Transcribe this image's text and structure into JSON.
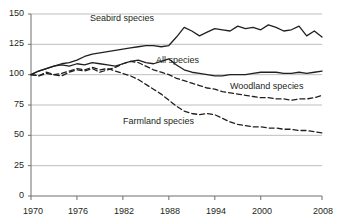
{
  "chart_data": {
    "type": "line",
    "title": "",
    "subtitle": "",
    "xlabel": "",
    "ylabel": "",
    "xlim": [
      1970,
      2008
    ],
    "ylim": [
      0,
      150
    ],
    "yticks": [
      0,
      25,
      50,
      75,
      100,
      125,
      150
    ],
    "ytick_labels": [
      "0",
      "25",
      "50",
      "75",
      "100",
      "125",
      "150"
    ],
    "xticks": [
      1970,
      1976,
      1982,
      1988,
      1994,
      2000,
      2008
    ],
    "xtick_labels": [
      "1970",
      "1976",
      "1982",
      "1988",
      "1994",
      "2000",
      "2008"
    ],
    "grid": "horizontal",
    "legend": "inline-annotations",
    "index_base": 100,
    "x": [
      1970,
      1971,
      1972,
      1973,
      1974,
      1975,
      1976,
      1977,
      1978,
      1979,
      1980,
      1981,
      1982,
      1983,
      1984,
      1985,
      1986,
      1987,
      1988,
      1989,
      1990,
      1991,
      1992,
      1993,
      1994,
      1995,
      1996,
      1997,
      1998,
      1999,
      2000,
      2001,
      2002,
      2003,
      2004,
      2005,
      2006,
      2007,
      2008
    ],
    "series": [
      {
        "name": "Seabird species",
        "style": "solid",
        "color": "#231f20",
        "label_x": 1977.5,
        "label_y": 137,
        "values": [
          100,
          103,
          105,
          107,
          109,
          110,
          112,
          115,
          117,
          118,
          119,
          120,
          121,
          122,
          123,
          124,
          124,
          123,
          124,
          131,
          139,
          136,
          132,
          135,
          138,
          137,
          136,
          140,
          138,
          139,
          137,
          141,
          139,
          136,
          137,
          140,
          132,
          136,
          131
        ]
      },
      {
        "name": "All species",
        "style": "solid",
        "color": "#231f20",
        "label_x": 1989.5,
        "label_y": 108,
        "values": [
          100,
          103,
          105,
          107,
          108,
          107,
          109,
          108,
          110,
          109,
          108,
          107,
          109,
          111,
          112,
          110,
          109,
          111,
          113,
          108,
          104,
          102,
          101,
          100,
          99,
          99,
          100,
          100,
          100,
          101,
          102,
          102,
          102,
          101,
          101,
          102,
          101,
          102,
          103
        ]
      },
      {
        "name": "Woodland species",
        "style": "dashed",
        "color": "#231f20",
        "label_x": 1998.0,
        "label_y": 88,
        "values": [
          100,
          99,
          101,
          100,
          99,
          102,
          104,
          103,
          105,
          102,
          104,
          106,
          109,
          111,
          110,
          107,
          104,
          102,
          100,
          97,
          95,
          93,
          91,
          89,
          88,
          86,
          85,
          84,
          83,
          82,
          81,
          81,
          80,
          80,
          79,
          80,
          80,
          81,
          83
        ]
      },
      {
        "name": "Farmland species",
        "style": "dashed",
        "color": "#231f20",
        "label_x": 1981.5,
        "label_y": 66,
        "values": [
          100,
          99,
          102,
          100,
          101,
          103,
          105,
          104,
          106,
          104,
          105,
          103,
          101,
          99,
          96,
          92,
          88,
          84,
          79,
          74,
          70,
          68,
          67,
          68,
          67,
          64,
          61,
          59,
          58,
          57,
          57,
          56,
          56,
          55,
          55,
          54,
          54,
          53,
          52
        ]
      }
    ]
  },
  "axis": {
    "tick_color": "#8c8c8c",
    "grid_color": "#bfbfbf",
    "axis_line_color": "#6e6e6e"
  }
}
